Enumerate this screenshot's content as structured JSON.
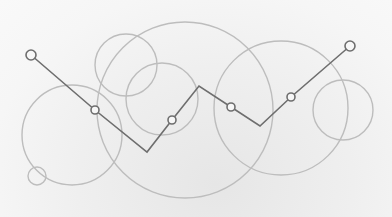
{
  "illustration": {
    "description": "Zig-zag polyline with hollow circle nodes over overlapping outline circles",
    "colors": {
      "background": "#f3f3f3",
      "circle_stroke": "#bdbdbd",
      "line_stroke": "#6e6e6e",
      "node_fill": "#f7f7f7"
    },
    "circles": [
      {
        "cx": 72,
        "cy": 135,
        "r": 50
      },
      {
        "cx": 37,
        "cy": 176,
        "r": 9
      },
      {
        "cx": 126,
        "cy": 65,
        "r": 31
      },
      {
        "cx": 162,
        "cy": 99,
        "r": 36
      },
      {
        "cx": 185,
        "cy": 110,
        "r": 88
      },
      {
        "cx": 281,
        "cy": 108,
        "r": 67
      },
      {
        "cx": 343,
        "cy": 110,
        "r": 30
      }
    ],
    "polyline": [
      {
        "x": 31,
        "y": 55,
        "node": true,
        "node_r": 5
      },
      {
        "x": 95,
        "y": 110,
        "node": true,
        "node_r": 4
      },
      {
        "x": 147,
        "y": 152,
        "node": false
      },
      {
        "x": 172,
        "y": 120,
        "node": true,
        "node_r": 4
      },
      {
        "x": 199,
        "y": 86,
        "node": false
      },
      {
        "x": 231,
        "y": 107,
        "node": true,
        "node_r": 4
      },
      {
        "x": 260,
        "y": 126,
        "node": false
      },
      {
        "x": 291,
        "y": 97,
        "node": true,
        "node_r": 4
      },
      {
        "x": 350,
        "y": 46,
        "node": true,
        "node_r": 5
      }
    ]
  }
}
